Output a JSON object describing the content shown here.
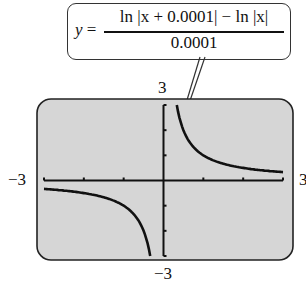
{
  "equation": {
    "lhs": "y",
    "equals": " =",
    "numerator": "ln |x + 0.0001| − ln |x|",
    "denominator": "0.0001"
  },
  "axis_labels": {
    "ymax": "3",
    "ymin": "−3",
    "xmin": "−3",
    "xmax": "3"
  },
  "chart_data": {
    "type": "line",
    "xlabel": "",
    "ylabel": "",
    "xlim": [
      -3,
      3
    ],
    "ylim": [
      -3,
      3
    ],
    "x_ticks": [
      -3,
      -2,
      -1,
      0,
      1,
      2,
      3
    ],
    "y_ticks": [
      -3,
      -2,
      -1,
      0,
      1,
      2,
      3
    ],
    "grid": false,
    "series": [
      {
        "name": "y ≈ 1/x (x<0)",
        "x": [
          -3,
          -2.5,
          -2,
          -1.5,
          -1,
          -0.75,
          -0.5,
          -0.4,
          -0.34
        ],
        "y": [
          -0.33,
          -0.4,
          -0.5,
          -0.67,
          -1,
          -1.33,
          -2,
          -2.5,
          -3
        ]
      },
      {
        "name": "y ≈ 1/x (x>0)",
        "x": [
          0.34,
          0.4,
          0.5,
          0.75,
          1,
          1.5,
          2,
          2.5,
          3
        ],
        "y": [
          3,
          2.5,
          2,
          1.33,
          1,
          0.67,
          0.5,
          0.4,
          0.33
        ]
      }
    ],
    "colors": {
      "screen": "#d6d6d6",
      "curve": "#111111"
    }
  }
}
